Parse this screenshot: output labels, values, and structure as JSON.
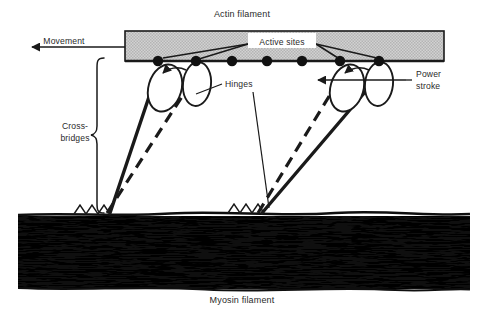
{
  "diagram": {
    "title_top": "Actin filament",
    "title_bottom": "Myosin filament",
    "labels": {
      "movement": "Movement",
      "active_sites": "Active sites",
      "hinges": "Hinges",
      "cross_bridges_line1": "Cross-",
      "cross_bridges_line2": "bridges",
      "power_stroke_line1": "Power",
      "power_stroke_line2": "stroke"
    },
    "colors": {
      "actin_fill": "#c9c9c9",
      "actin_stroke": "#1a1a1a",
      "myosin_fill": "#141414",
      "ink": "#1a1a1a",
      "text": "#2a2a2a",
      "background": "#ffffff"
    },
    "active_sites": {
      "count": 7,
      "radius": 5.2,
      "x_positions": [
        158,
        196,
        232,
        267,
        302,
        340,
        379
      ],
      "y": 61
    },
    "crossbridges": {
      "count": 4,
      "groups": [
        {
          "side": "left",
          "heads": [
            {
              "cx": 158,
              "cy": 61,
              "state": "attached-solid"
            },
            {
              "cx": 196,
              "cy": 61,
              "state": "attached-dashed"
            }
          ],
          "foot_x": 112
        },
        {
          "side": "right",
          "heads": [
            {
              "cx": 340,
              "cy": 61,
              "state": "attached-solid"
            },
            {
              "cx": 379,
              "cy": 61,
              "state": "attached-dashed"
            }
          ],
          "foot_x": 262
        }
      ]
    },
    "actin_bar": {
      "x": 125,
      "y": 31,
      "width": 319,
      "height": 30
    },
    "myosin_band": {
      "x": 18,
      "y": 212,
      "width": 452,
      "height": 77
    }
  }
}
